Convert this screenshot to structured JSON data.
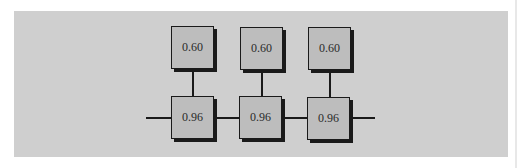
{
  "diagram": {
    "type": "series-parallel reliability network",
    "top_boxes": [
      {
        "label": "0.60"
      },
      {
        "label": "0.60"
      },
      {
        "label": "0.60"
      }
    ],
    "bottom_boxes": [
      {
        "label": "0.96"
      },
      {
        "label": "0.96"
      },
      {
        "label": "0.96"
      }
    ],
    "colors": {
      "panel": "#cfcfcf",
      "box_fill": "#bdbdbd",
      "line": "#1a1a1a"
    }
  }
}
